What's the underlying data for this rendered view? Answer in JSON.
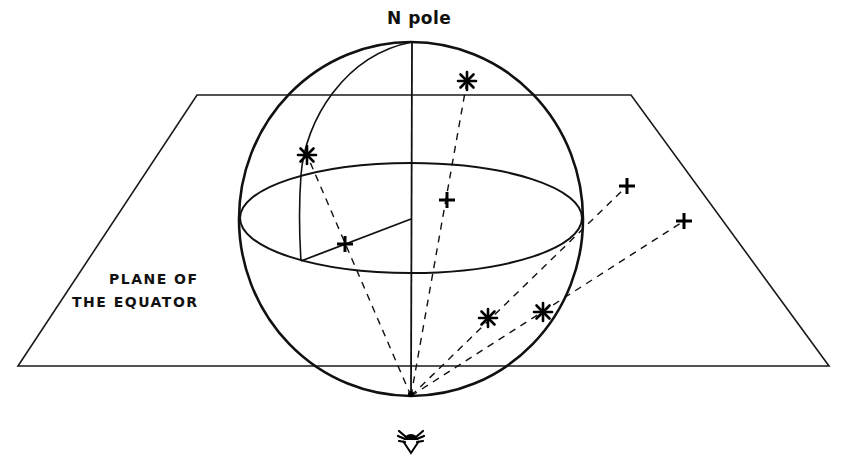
{
  "diagram": {
    "labels": {
      "pole": "N pole",
      "plane_line1": "PLANE OF",
      "plane_line2": "THE EQUATOR"
    },
    "plane": {
      "corners": [
        [
          197,
          95
        ],
        [
          631,
          95
        ],
        [
          829,
          366
        ],
        [
          18,
          366
        ]
      ]
    },
    "sphere": {
      "center": [
        411,
        219
      ],
      "rx": 172,
      "ry": 177,
      "north_pole": [
        412,
        42
      ],
      "south_pole": [
        411,
        396
      ]
    },
    "equator": {
      "center": [
        411,
        218
      ],
      "rx": 171,
      "ry": 55
    },
    "observer": {
      "icon": "eye-icon",
      "position": [
        411,
        440
      ]
    },
    "stars": [
      {
        "id": "star-1",
        "position": [
          307,
          155
        ],
        "projection": [
          345,
          244
        ]
      },
      {
        "id": "star-2",
        "position": [
          467,
          81
        ],
        "projection": [
          447,
          200
        ]
      },
      {
        "id": "star-3",
        "position": [
          488,
          318
        ],
        "projection": [
          627,
          186
        ]
      },
      {
        "id": "star-4",
        "position": [
          543,
          312
        ],
        "projection": [
          684,
          221
        ]
      }
    ],
    "colors": {
      "ink": "#111111",
      "background": "#ffffff"
    }
  }
}
